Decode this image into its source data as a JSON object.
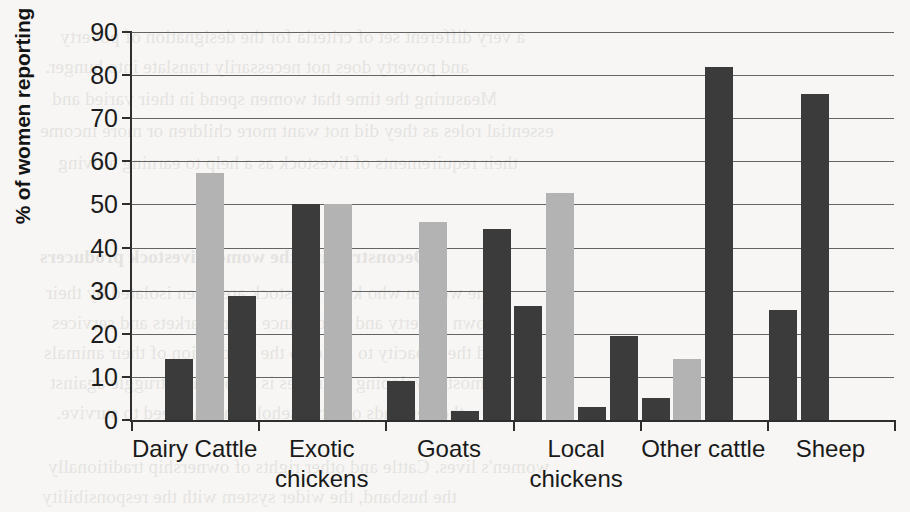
{
  "chart_data": {
    "type": "bar",
    "title": "",
    "xlabel": "",
    "ylabel": "% of women reporting",
    "ylim": [
      0,
      90
    ],
    "ytick_step": 10,
    "yticks": [
      0,
      10,
      20,
      30,
      40,
      50,
      60,
      70,
      80,
      90
    ],
    "grid": true,
    "legend": "none",
    "categories": [
      "Dairy Cattle",
      "Exotic chickens",
      "Goats",
      "Local chickens",
      "Other cattle",
      "Sheep"
    ],
    "category_lines": [
      [
        "Dairy Cattle"
      ],
      [
        "Exotic",
        "chickens"
      ],
      [
        "Goats"
      ],
      [
        "Local",
        "chickens"
      ],
      [
        "Other cattle"
      ],
      [
        "Sheep"
      ]
    ],
    "slots_per_group": 4,
    "series": [
      {
        "name": "Series 1",
        "color": "#3b3b3b",
        "values": [
          14.2,
          50.0,
          9.1,
          26.5,
          5.0,
          25.5
        ]
      },
      {
        "name": "Series 2",
        "color": "#b3b3b3",
        "values": [
          57.2,
          50.0,
          46.0,
          52.6,
          14.2,
          0
        ]
      },
      {
        "name": "Series 3",
        "color": "#3b3b3b",
        "values": [
          28.7,
          0,
          2.1,
          3.1,
          82.0,
          75.6
        ]
      },
      {
        "name": "Series 4",
        "color": "#3b3b3b",
        "values": [
          0,
          0,
          44.2,
          19.5,
          0,
          0
        ]
      }
    ],
    "bars": [
      {
        "group": "Dairy Cattle",
        "slot": 1,
        "value": 14.2,
        "color": "#3b3b3b"
      },
      {
        "group": "Dairy Cattle",
        "slot": 2,
        "value": 57.2,
        "color": "#b3b3b3"
      },
      {
        "group": "Dairy Cattle",
        "slot": 3,
        "value": 28.7,
        "color": "#3b3b3b"
      },
      {
        "group": "Exotic chickens",
        "slot": 1,
        "value": 50.0,
        "color": "#3b3b3b"
      },
      {
        "group": "Exotic chickens",
        "slot": 2,
        "value": 50.0,
        "color": "#b3b3b3"
      },
      {
        "group": "Goats",
        "slot": 0,
        "value": 9.1,
        "color": "#3b3b3b"
      },
      {
        "group": "Goats",
        "slot": 1,
        "value": 46.0,
        "color": "#b3b3b3"
      },
      {
        "group": "Goats",
        "slot": 2,
        "value": 2.1,
        "color": "#3b3b3b"
      },
      {
        "group": "Goats",
        "slot": 3,
        "value": 44.2,
        "color": "#3b3b3b"
      },
      {
        "group": "Local chickens",
        "slot": 0,
        "value": 26.5,
        "color": "#3b3b3b"
      },
      {
        "group": "Local chickens",
        "slot": 1,
        "value": 52.6,
        "color": "#b3b3b3"
      },
      {
        "group": "Local chickens",
        "slot": 2,
        "value": 3.1,
        "color": "#3b3b3b"
      },
      {
        "group": "Local chickens",
        "slot": 3,
        "value": 19.5,
        "color": "#3b3b3b"
      },
      {
        "group": "Other cattle",
        "slot": 0,
        "value": 5.0,
        "color": "#3b3b3b"
      },
      {
        "group": "Other cattle",
        "slot": 1,
        "value": 14.2,
        "color": "#b3b3b3"
      },
      {
        "group": "Other cattle",
        "slot": 2,
        "value": 82.0,
        "color": "#3b3b3b"
      },
      {
        "group": "Sheep",
        "slot": 0,
        "value": 25.5,
        "color": "#3b3b3b"
      },
      {
        "group": "Sheep",
        "slot": 1,
        "value": 75.6,
        "color": "#3b3b3b"
      }
    ]
  },
  "page": {
    "background_color": "#f7f6f4",
    "dark_bar_color": "#3b3b3b",
    "light_bar_color": "#b3b3b3",
    "axis_color": "#2e2e2e"
  },
  "bleed_text": {
    "lines": [
      "a very different set of criteria for the designation of poverty",
      "and poverty does not necessarily translate into hunger.",
      "Measuring the time that women spend in their varied and",
      "essential roles as they did not want more children or more income",
      "their requirements of livestock as a help to earning a living",
      "Deconstructing the women livestock producers",
      "The women who keep livestock are often isolated by their",
      "own poverty and by distance from markets and services",
      "and the capacity to scale up the production of their animals",
      "in most developing countries is a constant struggle against",
      "the demands of a household and the need to survive.",
      "women's lives. Cattle and other rights of ownership traditionally",
      "the husband, the wider system with the responsibility"
    ]
  }
}
